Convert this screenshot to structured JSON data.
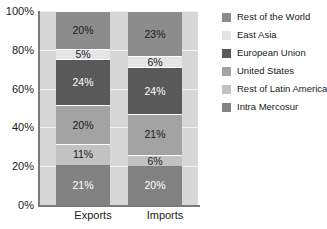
{
  "chart_data": {
    "type": "bar",
    "stacked": true,
    "title": "",
    "subtitle": "",
    "xlabel": "",
    "ylabel": "",
    "categories": [
      "Exports",
      "Imports"
    ],
    "ylim": [
      0,
      100
    ],
    "y_ticks": [
      "0%",
      "20%",
      "40%",
      "60%",
      "80%",
      "100%"
    ],
    "y_tick_values": [
      0,
      20,
      40,
      60,
      80,
      100
    ],
    "grid": true,
    "legend_position": "right",
    "stack_order_bottom_to_top": [
      "Intra Mercosur",
      "Rest of Latin America",
      "United States",
      "European Union",
      "East Asia",
      "Rest of the World"
    ],
    "series": [
      {
        "name": "Rest of the World",
        "color": "#8c8c8c",
        "label_color": "#1a1a1a",
        "values": [
          20,
          23
        ],
        "labels": [
          "20%",
          "23%"
        ]
      },
      {
        "name": "East Asia",
        "color": "#e4e4e4",
        "label_color": "#1a1a1a",
        "values": [
          5,
          6
        ],
        "labels": [
          "5%",
          "6%"
        ]
      },
      {
        "name": "European Union",
        "color": "#595959",
        "label_color": "#ffffff",
        "values": [
          24,
          24
        ],
        "labels": [
          "24%",
          "24%"
        ]
      },
      {
        "name": "United States",
        "color": "#a3a3a3",
        "label_color": "#1a1a1a",
        "values": [
          20,
          21
        ],
        "labels": [
          "20%",
          "21%"
        ]
      },
      {
        "name": "Rest of Latin America",
        "color": "#c2c2c2",
        "label_color": "#1a1a1a",
        "values": [
          11,
          6
        ],
        "labels": [
          "11%",
          "6%"
        ]
      },
      {
        "name": "Intra Mercosur",
        "color": "#828282",
        "label_color": "#ffffff",
        "values": [
          21,
          20
        ],
        "labels": [
          "21%",
          "20%"
        ]
      }
    ]
  },
  "legend": {
    "items": [
      {
        "label": "Rest of the World",
        "color": "#8c8c8c"
      },
      {
        "label": "East Asia",
        "color": "#e4e4e4"
      },
      {
        "label": "European Union",
        "color": "#595959"
      },
      {
        "label": "United States",
        "color": "#a3a3a3"
      },
      {
        "label": "Rest of Latin America",
        "color": "#c2c2c2"
      },
      {
        "label": "Intra Mercosur",
        "color": "#828282"
      }
    ]
  },
  "colors": {
    "plot_background": "#d7d7d7",
    "axis": "#7a7a7a",
    "gridline": "#f2f2f2",
    "page_background": "#ffffff",
    "text": "#1a1a1a"
  }
}
